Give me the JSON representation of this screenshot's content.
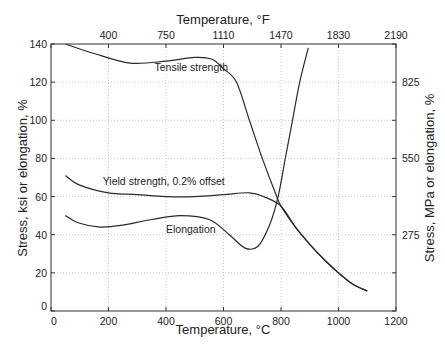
{
  "chart_data": {
    "type": "line",
    "title": "",
    "xlabel": "Temperature, °C",
    "x2label": "Temperature, °F",
    "ylabel": "Stress, ksi or elongation, %",
    "y2label": "Stress, MPa or elongation, %",
    "xlim": [
      0,
      1200
    ],
    "ylim": [
      0,
      140
    ],
    "grid": true,
    "x_ticks": [
      "0",
      "200",
      "400",
      "600",
      "800",
      "1000",
      "1200"
    ],
    "x2_ticks": [
      "400",
      "750",
      "1110",
      "1470",
      "1830",
      "2190"
    ],
    "y_ticks": [
      "0",
      "20",
      "40",
      "60",
      "80",
      "100",
      "120",
      "140"
    ],
    "y2_ticks": [
      "275",
      "550",
      "825"
    ],
    "series": [
      {
        "name": "Tensile strength",
        "x": [
          50,
          150,
          275,
          400,
          500,
          560,
          600,
          645,
          690,
          735,
          780,
          800,
          850,
          900,
          950,
          1000,
          1050,
          1100
        ],
        "y": [
          140,
          135,
          130,
          131,
          133,
          132,
          127,
          120,
          100,
          80,
          62,
          55,
          44,
          35,
          27,
          20,
          14,
          10.5
        ]
      },
      {
        "name": "Yield strength, 0.2% offset",
        "x": [
          50,
          100,
          200,
          300,
          400,
          500,
          600,
          690,
          740,
          800,
          850,
          900,
          950,
          1000,
          1050,
          1100
        ],
        "y": [
          71,
          66,
          62,
          61,
          60,
          60,
          61,
          62,
          60,
          55,
          44,
          35,
          27,
          20,
          14,
          10.5
        ]
      },
      {
        "name": "Elongation",
        "x": [
          50,
          100,
          170,
          250,
          350,
          450,
          550,
          620,
          675,
          720,
          760,
          790,
          815,
          840,
          865,
          895
        ],
        "y": [
          50,
          46,
          44,
          45,
          48,
          50,
          48,
          40,
          33,
          34,
          45,
          60,
          80,
          100,
          120,
          138
        ]
      }
    ],
    "annotations": [
      {
        "text": "Tensile strength",
        "x": 360,
        "y": 126
      },
      {
        "text": "Yield strength, 0.2% offset",
        "x": 180,
        "y": 66
      },
      {
        "text": "Elongation",
        "x": 400,
        "y": 41
      }
    ]
  }
}
